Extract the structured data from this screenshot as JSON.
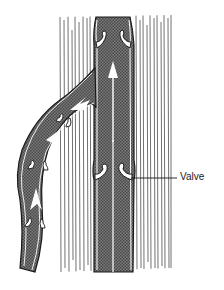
{
  "diagram": {
    "labels": [
      {
        "id": "valve",
        "text": "Valve"
      }
    ],
    "colors": {
      "vein_fill": "#6a6a6a",
      "vein_outline": "#1a1a1a",
      "tissue_lines": "#555555",
      "background": "#ffffff",
      "flow_arrow": "#ffffff"
    },
    "elements": [
      {
        "name": "muscle-tissue",
        "type": "textured background with vertical lines"
      },
      {
        "name": "main-vein",
        "type": "vertical vessel"
      },
      {
        "name": "branch-vein",
        "type": "curved tributary joining main vein"
      },
      {
        "name": "upper-valve",
        "type": "valve cusps near top of main vein"
      },
      {
        "name": "lower-valve",
        "type": "valve cusps mid main vein"
      },
      {
        "name": "branch-valves",
        "type": "valve cusps within branch vein"
      },
      {
        "name": "flow-arrows",
        "type": "white arrows indicating upward blood flow"
      }
    ]
  }
}
